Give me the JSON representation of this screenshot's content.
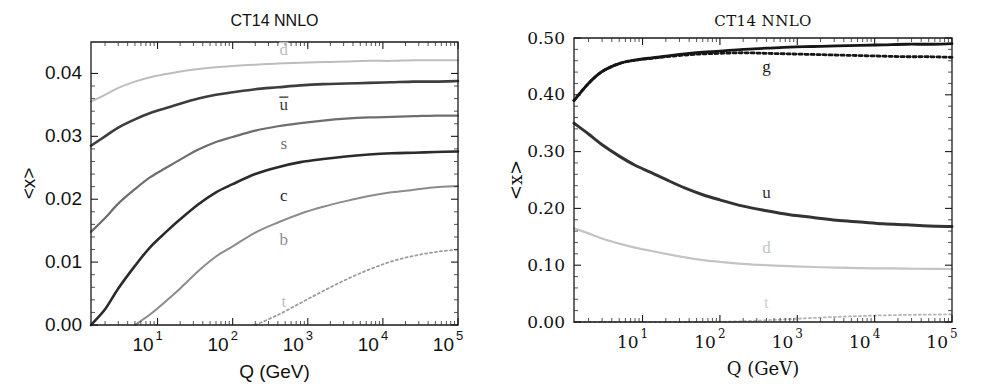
{
  "figure": {
    "panels": [
      "left",
      "right"
    ],
    "background": "#ffffff"
  },
  "left_panel": {
    "title": "CT14 NNLO",
    "xlabel": "Q (GeV)",
    "ylabel": "<x>",
    "ytick_labels": [
      "0.00",
      "0.01",
      "0.02",
      "0.03",
      "0.04"
    ],
    "xtick_mantissa": "10",
    "xtick_exponents": [
      "1",
      "2",
      "3",
      "4",
      "5"
    ],
    "curve_labels": {
      "dbar": "d",
      "ubar": "u",
      "s": "s",
      "c": "c",
      "b": "b",
      "t": "t"
    }
  },
  "right_panel": {
    "title": "CT14  NNLO",
    "xlabel": "Q  (GeV)",
    "ylabel": "<x>",
    "ytick_labels": [
      "0.00",
      "0.10",
      "0.20",
      "0.30",
      "0.40",
      "0.50"
    ],
    "xtick_mantissa": "10",
    "xtick_exponents": [
      "1",
      "2",
      "3",
      "4",
      "5"
    ],
    "curve_labels": {
      "g": "g",
      "u": "u",
      "d": "d",
      "t": "t"
    }
  },
  "chart_data": [
    {
      "type": "line",
      "panel": "left",
      "title": "CT14 NNLO",
      "xlabel": "Q (GeV)",
      "ylabel": "<x>",
      "xscale": "log",
      "xlim": [
        1.3,
        100000
      ],
      "ylim": [
        0.0,
        0.045
      ],
      "yticks": [
        0.0,
        0.01,
        0.02,
        0.03,
        0.04
      ],
      "xticks": [
        10,
        100,
        1000,
        10000,
        100000
      ],
      "grid": false,
      "legend": "inline-annotations",
      "x": [
        1.3,
        2,
        3,
        5,
        8,
        13,
        20,
        35,
        60,
        100,
        200,
        400,
        800,
        1600,
        3200,
        6500,
        13000,
        26000,
        50000,
        100000
      ],
      "series": [
        {
          "name": "dbar",
          "label": "d",
          "color": "#bdbdbd",
          "width": 2.0,
          "dash": "none",
          "values": [
            0.0355,
            0.0366,
            0.0377,
            0.0387,
            0.0394,
            0.0399,
            0.0403,
            0.0407,
            0.041,
            0.0412,
            0.0414,
            0.0416,
            0.0417,
            0.0418,
            0.0419,
            0.042,
            0.042,
            0.0421,
            0.0421,
            0.0421
          ]
        },
        {
          "name": "ubar",
          "label": "u",
          "color": "#3d3d3d",
          "width": 2.6,
          "dash": "none",
          "values": [
            0.0285,
            0.03,
            0.0314,
            0.0327,
            0.0337,
            0.0345,
            0.0352,
            0.036,
            0.0366,
            0.037,
            0.0375,
            0.0378,
            0.0381,
            0.0383,
            0.0384,
            0.0385,
            0.0386,
            0.0387,
            0.0387,
            0.0388
          ]
        },
        {
          "name": "s",
          "label": "s",
          "color": "#6e6e6e",
          "width": 2.2,
          "dash": "none",
          "values": [
            0.0148,
            0.017,
            0.0193,
            0.0216,
            0.0235,
            0.025,
            0.0263,
            0.0279,
            0.0291,
            0.0299,
            0.0309,
            0.0316,
            0.0321,
            0.0325,
            0.0328,
            0.033,
            0.0331,
            0.0332,
            0.0333,
            0.0333
          ]
        },
        {
          "name": "c",
          "label": "c",
          "color": "#2b2b2b",
          "width": 2.6,
          "dash": "none",
          "values": [
            0.0,
            0.0025,
            0.0058,
            0.0094,
            0.0124,
            0.0148,
            0.0168,
            0.0192,
            0.0211,
            0.0224,
            0.024,
            0.0251,
            0.0259,
            0.0264,
            0.0268,
            0.0271,
            0.0273,
            0.0274,
            0.0275,
            0.0276
          ]
        },
        {
          "name": "b",
          "label": "b",
          "color": "#8c8c8c",
          "width": 2.0,
          "dash": "none",
          "values": [
            null,
            null,
            null,
            0.0,
            0.0017,
            0.0038,
            0.0058,
            0.0086,
            0.0109,
            0.0125,
            0.0147,
            0.0163,
            0.0177,
            0.0188,
            0.0197,
            0.0205,
            0.0211,
            0.0215,
            0.0219,
            0.0221
          ]
        },
        {
          "name": "t",
          "label": "t",
          "color": "#9c9c9c",
          "width": 1.8,
          "dash": "2,3",
          "values": [
            null,
            null,
            null,
            null,
            null,
            null,
            null,
            null,
            null,
            null,
            0.0,
            0.0016,
            0.0035,
            0.0054,
            0.0072,
            0.0088,
            0.0101,
            0.011,
            0.0116,
            0.012
          ]
        }
      ]
    },
    {
      "type": "line",
      "panel": "right",
      "title": "CT14  NNLO",
      "xlabel": "Q  (GeV)",
      "ylabel": "<x>",
      "xscale": "log",
      "xlim": [
        1.3,
        100000
      ],
      "ylim": [
        0.0,
        0.5
      ],
      "yticks": [
        0.0,
        0.1,
        0.2,
        0.3,
        0.4,
        0.5
      ],
      "xticks": [
        10,
        100,
        1000,
        10000,
        100000
      ],
      "grid": false,
      "legend": "inline-annotations",
      "x": [
        1.3,
        2,
        3,
        5,
        8,
        13,
        20,
        35,
        60,
        100,
        200,
        400,
        800,
        1600,
        3200,
        6500,
        13000,
        26000,
        50000,
        100000
      ],
      "series": [
        {
          "name": "g_solid",
          "label": "g",
          "color": "#161616",
          "width": 2.8,
          "dash": "none",
          "values": [
            0.39,
            0.42,
            0.441,
            0.455,
            0.461,
            0.465,
            0.468,
            0.472,
            0.475,
            0.477,
            0.48,
            0.482,
            0.484,
            0.485,
            0.486,
            0.487,
            0.488,
            0.489,
            0.489,
            0.49
          ]
        },
        {
          "name": "g_dotted",
          "label": "g",
          "color": "#161616",
          "width": 2.8,
          "dash": "3,3",
          "values": [
            0.39,
            0.42,
            0.441,
            0.455,
            0.461,
            0.464,
            0.467,
            0.47,
            0.472,
            0.473,
            0.474,
            0.473,
            0.472,
            0.471,
            0.47,
            0.469,
            0.468,
            0.467,
            0.467,
            0.466
          ]
        },
        {
          "name": "u",
          "label": "u",
          "color": "#333333",
          "width": 3.0,
          "dash": "none",
          "values": [
            0.35,
            0.331,
            0.312,
            0.292,
            0.276,
            0.263,
            0.251,
            0.236,
            0.224,
            0.215,
            0.204,
            0.196,
            0.189,
            0.184,
            0.179,
            0.176,
            0.173,
            0.171,
            0.169,
            0.168
          ]
        },
        {
          "name": "d",
          "label": "d",
          "color": "#c4c4c4",
          "width": 2.2,
          "dash": "none",
          "values": [
            0.165,
            0.156,
            0.147,
            0.138,
            0.131,
            0.125,
            0.12,
            0.114,
            0.109,
            0.106,
            0.1025,
            0.1,
            0.0982,
            0.0968,
            0.0958,
            0.095,
            0.0944,
            0.094,
            0.0936,
            0.0933
          ]
        },
        {
          "name": "t",
          "label": "t",
          "color": "#b5b5b5",
          "width": 1.8,
          "dash": "2,3",
          "values": [
            0.0,
            0.0,
            0.0,
            0.0,
            0.0,
            0.0,
            0.0,
            0.0,
            0.0,
            0.0005,
            0.0014,
            0.0032,
            0.0052,
            0.0072,
            0.009,
            0.0105,
            0.0117,
            0.0125,
            0.013,
            0.0134
          ]
        }
      ],
      "annotations": [
        {
          "label": "g",
          "x": 400,
          "y": 0.447
        },
        {
          "label": "u",
          "x": 400,
          "y": 0.225
        },
        {
          "label": "d",
          "x": 400,
          "y": 0.128
        },
        {
          "label": "t",
          "x": 400,
          "y": 0.03
        }
      ]
    }
  ]
}
